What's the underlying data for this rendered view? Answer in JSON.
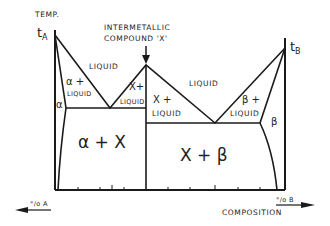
{
  "diagram": {
    "type": "binary phase diagram with intermetallic compound",
    "axis": {
      "y_label": "TEMP.",
      "x_label": "COMPOSITION",
      "left_arrow_label": "°/o A",
      "right_arrow_label": "°/o B"
    },
    "points": {
      "t_a": {
        "label_main": "t",
        "label_sub": "A"
      },
      "t_b": {
        "label_main": "t",
        "label_sub": "B"
      }
    },
    "annotation": {
      "line1": "INTERMETALLIC",
      "line2": "COMPOUND 'X'"
    },
    "regions": {
      "liquid_left": "LIQUID",
      "liquid_right": "LIQUID",
      "alpha_liquid_1": "α +",
      "alpha_liquid_2": "LIQUID",
      "x_liquid_left_1": "X+",
      "x_liquid_left_2": "LIQUID",
      "x_liquid_right_1": "X +",
      "x_liquid_right_2": "LIQUID",
      "beta_liquid_1": "β +",
      "beta_liquid_2": "LIQUID",
      "alpha": "α",
      "beta": "β",
      "alpha_x": "α + X",
      "x_beta": "X + β"
    },
    "colors": {
      "line": "#1a1a1a",
      "background": "#ffffff"
    }
  }
}
